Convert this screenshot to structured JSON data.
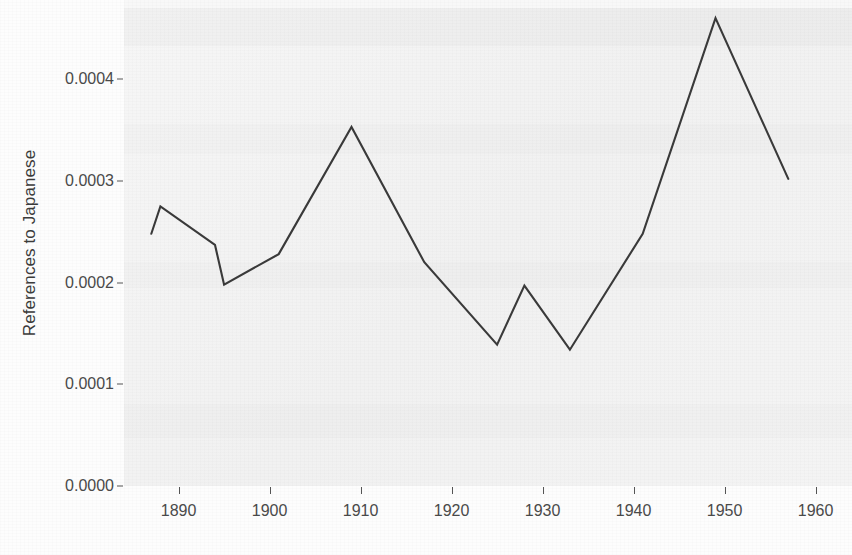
{
  "figure": {
    "background_color": "#fdfdfd",
    "panel_color": "#f4f4f4",
    "line_color": "#3a3a3a",
    "axis_text_color": "#4a4a4a"
  },
  "axis": {
    "y_title": "References to Japanese",
    "x_title": "",
    "y_tick_labels": [
      "0.0000",
      "0.0001",
      "0.0002",
      "0.0003",
      "0.0004"
    ],
    "x_tick_labels": [
      "1890",
      "1900",
      "1910",
      "1920",
      "1930",
      "1940",
      "1950",
      "1960"
    ]
  },
  "chart_data": {
    "type": "line",
    "title": "",
    "xlabel": "",
    "ylabel": "References to Japanese",
    "xlim": [
      1884,
      1964
    ],
    "ylim": [
      0.0,
      0.00047
    ],
    "grid": false,
    "legend": "none",
    "x_ticks": [
      1890,
      1900,
      1910,
      1920,
      1930,
      1940,
      1950,
      1960
    ],
    "y_ticks": [
      0.0,
      0.0001,
      0.0002,
      0.0003,
      0.0004
    ],
    "series": [
      {
        "name": "References to Japanese",
        "color": "#3a3a3a",
        "x": [
          1887,
          1888,
          1894,
          1895,
          1901,
          1909,
          1917,
          1925,
          1928,
          1933,
          1941,
          1949,
          1957
        ],
        "values": [
          0.000248,
          0.000275,
          0.000237,
          0.000198,
          0.000228,
          0.000353,
          0.00022,
          0.000139,
          0.000197,
          0.000134,
          0.000248,
          0.00046,
          0.000302
        ]
      }
    ]
  }
}
